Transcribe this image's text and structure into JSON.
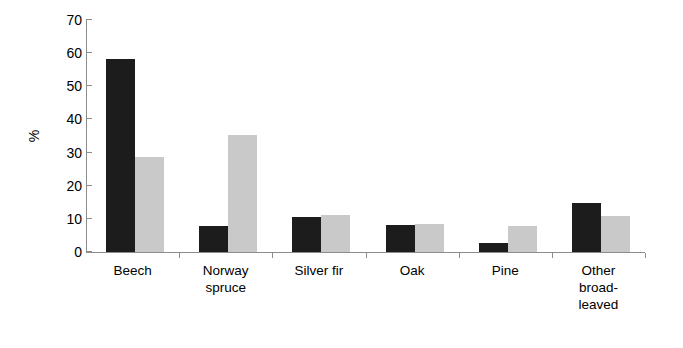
{
  "chart_data": {
    "type": "bar",
    "title": "",
    "subtitle": "",
    "xlabel": "",
    "ylabel": "%",
    "ylim": [
      0,
      70
    ],
    "yticks": [
      0,
      10,
      20,
      30,
      40,
      50,
      60,
      70
    ],
    "ytick_labels": [
      "0",
      "10",
      "20",
      "30",
      "40",
      "50",
      "60",
      "70"
    ],
    "grid": false,
    "legend": false,
    "legend_position": "none",
    "categories": [
      "Beech",
      "Norway\nspruce",
      "Silver fir",
      "Oak",
      "Pine",
      "Other\nbroad-\nleaved"
    ],
    "series": [
      {
        "name": "series-1",
        "color": "#1c1c1c",
        "values": [
          58.2,
          8.0,
          10.5,
          8.3,
          2.6,
          14.7
        ]
      },
      {
        "name": "series-2",
        "color": "#c9c9c9",
        "values": [
          28.7,
          35.2,
          11.3,
          8.5,
          7.7,
          10.9
        ]
      }
    ],
    "axis_color": "#8c8c8c"
  }
}
